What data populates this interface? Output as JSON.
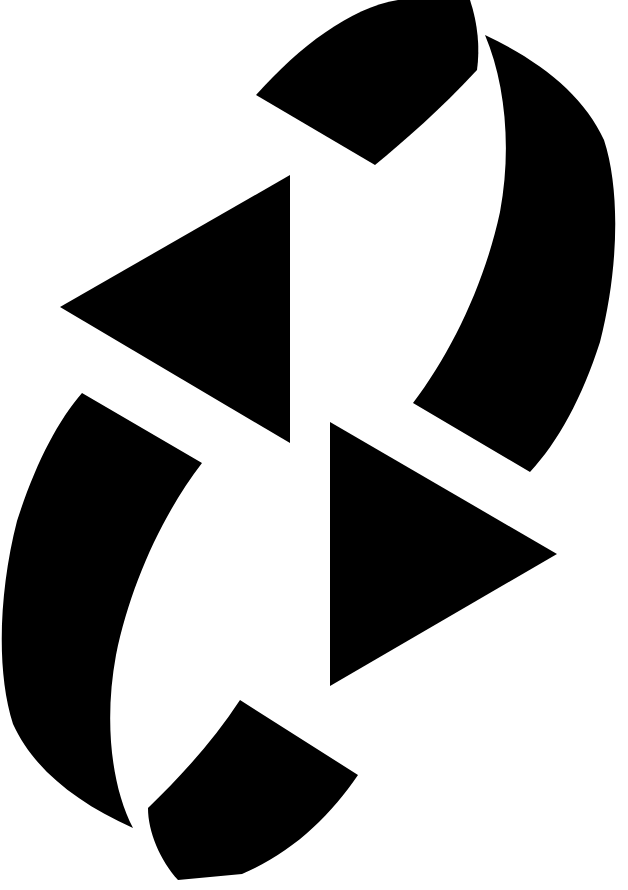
{
  "image": {
    "kind": "abstract-geometric-mark",
    "title": "Abstract Geometric Mark",
    "description": "Black-and-white abstract mark with 180-degree rotational symmetry, built from two solid triangles and four curved wedge shapes arranged around an empty centre.",
    "width": 628,
    "height": 890,
    "background_color": "#ffffff",
    "foreground_color": "#000000",
    "shape_count": 6
  },
  "shapes": [
    {
      "id": "top-arc-wedge",
      "label": "Top curved wedge",
      "role": "curved-wedge",
      "fill": "#000000",
      "path": "M 256 95 C 300 46 350 8 398 0 L 470 0 C 478 24 480 48 477 70 C 440 110 405 140 375 165 Z"
    },
    {
      "id": "upper-left-triangle",
      "label": "Upper-left triangle pointing left",
      "role": "triangle",
      "fill": "#000000",
      "points": "290,175 60,307 290,443",
      "path": "M 290 175 L 60 307 L 290 443 Z"
    },
    {
      "id": "right-crescent-wedge",
      "label": "Right large curved wedge",
      "role": "curved-wedge",
      "fill": "#000000",
      "path": "M 485 35 C 542 62 584 96 604 140 C 621 192 618 272 600 342 C 582 398 558 442 530 472 L 413 403 C 452 352 485 282 500 212 C 512 148 505 82 485 35 Z"
    },
    {
      "id": "left-crescent-wedge",
      "label": "Left large curved wedge",
      "role": "curved-wedge",
      "fill": "#000000",
      "path": "M 82 393 L 202 463 C 162 515 130 586 116 655 C 104 720 111 786 133 828 C 75 802 33 768 13 724 C -4 671 -1 591 17 521 C 35 465 57 422 82 393 Z"
    },
    {
      "id": "lower-right-triangle",
      "label": "Lower-right triangle pointing right",
      "role": "triangle",
      "fill": "#000000",
      "points": "330,422 330,686 557,554",
      "path": "M 330 422 L 330 686 L 557 554 Z"
    },
    {
      "id": "bottom-arc-wedge",
      "label": "Bottom curved wedge",
      "role": "curved-wedge",
      "fill": "#000000",
      "path": "M 240 700 L 358 775 C 330 816 292 853 242 874 L 178 880 C 160 860 148 832 148 808 C 182 775 214 740 240 700 Z"
    }
  ]
}
